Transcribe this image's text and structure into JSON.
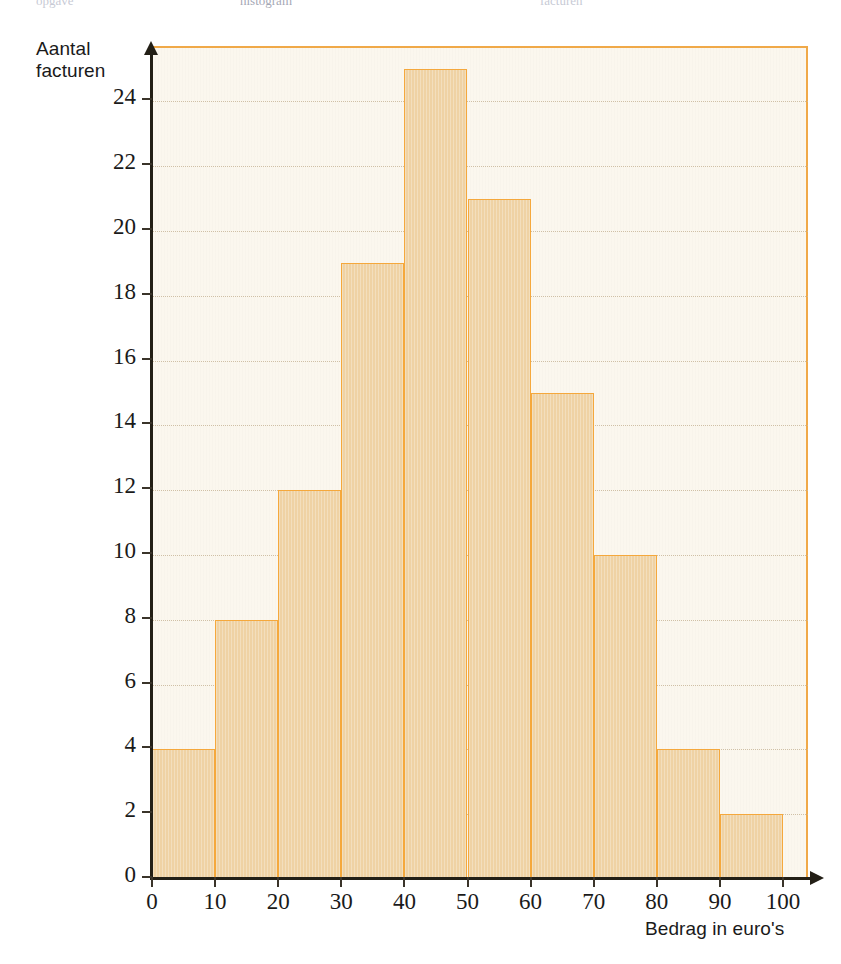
{
  "figure": {
    "top_cut_text": {
      "left": "opgave",
      "middle": "histogram",
      "right": "facturen"
    }
  },
  "chart_data": {
    "type": "bar",
    "title": "",
    "subtitle": "",
    "xlabel": "Bedrag in euro's",
    "ylabel": "Aantal facturen",
    "ylabel_line1": "Aantal",
    "ylabel_line2": "facturen",
    "xlim": [
      0,
      100
    ],
    "ylim": [
      0,
      26
    ],
    "grid": true,
    "grid_axis": "y",
    "legend": "none",
    "bin_width": 10,
    "bin_edges": [
      0,
      10,
      20,
      30,
      40,
      50,
      60,
      70,
      80,
      90,
      100
    ],
    "categories": [
      "0-10",
      "10-20",
      "20-30",
      "30-40",
      "40-50",
      "50-60",
      "60-70",
      "70-80",
      "80-90",
      "90-100"
    ],
    "values": [
      4,
      8,
      12,
      19,
      25,
      21,
      15,
      10,
      4,
      2
    ],
    "total": 120,
    "xticks": [
      0,
      10,
      20,
      30,
      40,
      50,
      60,
      70,
      80,
      90,
      100
    ],
    "xticklabels": [
      "0",
      "10",
      "20",
      "30",
      "40",
      "50",
      "60",
      "70",
      "80",
      "90",
      "100"
    ],
    "yticks": [
      0,
      2,
      4,
      6,
      8,
      10,
      12,
      14,
      16,
      18,
      20,
      22,
      24
    ],
    "yticklabels": [
      "0",
      "2",
      "4",
      "6",
      "8",
      "10",
      "12",
      "14",
      "16",
      "18",
      "20",
      "22",
      "24"
    ],
    "colors": {
      "bar_fill": "#EFD2A4",
      "bar_edge": "#F5A83C",
      "plot_background": "#FBF7EE",
      "plot_border": "#F0A948",
      "axis": "#231F16",
      "gridline": "#C9B79A",
      "text": "#1A1A1A",
      "page_background": "#FFFFFF"
    }
  }
}
